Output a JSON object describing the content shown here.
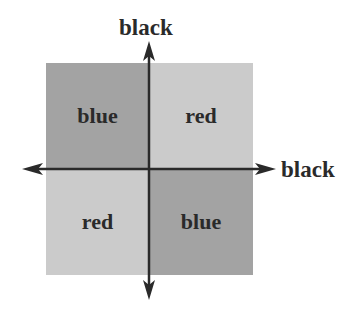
{
  "diagram": {
    "axes": {
      "vertical_label": "black",
      "horizontal_label": "black"
    },
    "quadrants": [
      {
        "position": "top-left",
        "label": "blue",
        "shade": "dark"
      },
      {
        "position": "top-right",
        "label": "red",
        "shade": "light"
      },
      {
        "position": "bottom-left",
        "label": "red",
        "shade": "light"
      },
      {
        "position": "bottom-right",
        "label": "blue",
        "shade": "dark"
      }
    ],
    "colors": {
      "dark_quadrant": "#a3a3a3",
      "light_quadrant": "#cbcbcb",
      "axis": "#2a2a2a",
      "text": "#2a2a2a"
    }
  }
}
